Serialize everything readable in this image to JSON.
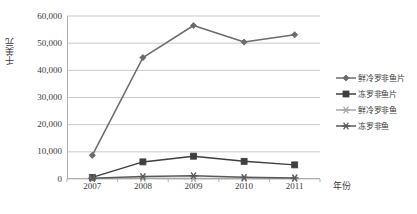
{
  "chart_data": {
    "type": "line",
    "title": "",
    "xlabel": "年份",
    "ylabel": "千美元",
    "categories": [
      "2007",
      "2008",
      "2009",
      "2010",
      "2011"
    ],
    "x": [
      2007,
      2008,
      2009,
      2010,
      2011
    ],
    "ylim": [
      0,
      60000
    ],
    "ytick_values": [
      0,
      10000,
      20000,
      30000,
      40000,
      50000,
      60000
    ],
    "ytick_labels": [
      "0",
      "10,000",
      "20,000",
      "30,000",
      "40,000",
      "50,000",
      "60,000"
    ],
    "grid": "horizontal",
    "legend_position": "right",
    "series": [
      {
        "name": "鲜冷罗非鱼片",
        "marker": "diamond",
        "color": "#6b6b6b",
        "values": [
          8700,
          44700,
          56500,
          50400,
          53100
        ]
      },
      {
        "name": "冻罗非鱼片",
        "marker": "square",
        "color": "#3f3f3f",
        "values": [
          600,
          6300,
          8400,
          6500,
          5200
        ]
      },
      {
        "name": "鲜冷罗非鱼",
        "marker": "asterisk",
        "color": "#a8a8a8",
        "values": [
          200,
          250,
          230,
          200,
          180
        ]
      },
      {
        "name": "冻罗非鱼",
        "marker": "asterisk",
        "color": "#5a5a5a",
        "values": [
          300,
          900,
          1200,
          600,
          400
        ]
      }
    ]
  },
  "axis": {
    "y_title": "千美元",
    "x_title": "年份"
  },
  "legend": {
    "items": [
      {
        "label": "鲜冷罗非鱼片",
        "marker": "diamond",
        "color": "#6b6b6b"
      },
      {
        "label": "冻罗非鱼片",
        "marker": "square",
        "color": "#3f3f3f"
      },
      {
        "label": "鲜冷罗非鱼",
        "marker": "asterisk",
        "color": "#a8a8a8"
      },
      {
        "label": "冻罗非鱼",
        "marker": "asterisk",
        "color": "#5a5a5a"
      }
    ]
  },
  "colors": {
    "gridline": "#c9c9c9",
    "axis": "#b0b0b0",
    "text": "#3a3a3a",
    "background": "#ffffff"
  }
}
